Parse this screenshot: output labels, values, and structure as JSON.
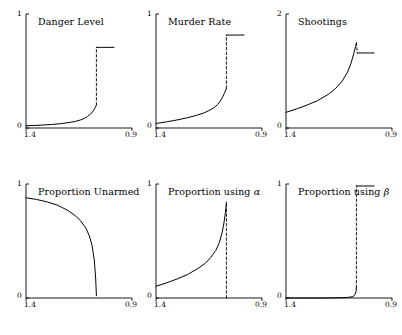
{
  "figure": {
    "kind": "small-multiples-line-grid",
    "rows": 2,
    "cols": 3,
    "background": "#ffffff",
    "line_color": "#000000",
    "axis_color": "#000000"
  },
  "chart_data": [
    {
      "type": "line",
      "title": "Danger Level",
      "xlabel": "",
      "ylabel": "",
      "xticklabels": [
        "1.4",
        "0.9"
      ],
      "yticklabels": [
        "0",
        "1"
      ],
      "xlim": [
        1.4,
        0.9
      ],
      "ylim": [
        0,
        1
      ],
      "x_reversed": true,
      "grid": false,
      "legend": "none",
      "annotations": [
        "dashed vertical discontinuity line at x = 1.0"
      ],
      "series": [
        {
          "name": "lower branch",
          "style": "solid",
          "x": [
            1.4,
            1.35,
            1.3,
            1.25,
            1.2,
            1.15,
            1.12,
            1.09,
            1.07,
            1.05,
            1.035,
            1.02,
            1.01,
            1.005,
            1.0
          ],
          "values": [
            0.02,
            0.023,
            0.027,
            0.032,
            0.039,
            0.05,
            0.059,
            0.072,
            0.085,
            0.103,
            0.122,
            0.148,
            0.172,
            0.19,
            0.205
          ]
        },
        {
          "name": "upper branch",
          "style": "solid",
          "x": [
            1.0,
            0.97,
            0.94,
            0.9
          ],
          "values": [
            0.72,
            0.72,
            0.72,
            0.72
          ]
        },
        {
          "name": "jump",
          "style": "dashed",
          "x": [
            1.0,
            1.0
          ],
          "values": [
            0.205,
            0.72
          ]
        }
      ]
    },
    {
      "type": "line",
      "title": "Murder Rate",
      "xlabel": "",
      "ylabel": "",
      "xticklabels": [
        "1.4",
        "0.9"
      ],
      "yticklabels": [
        "0",
        "1"
      ],
      "xlim": [
        1.4,
        0.9
      ],
      "ylim": [
        0,
        1
      ],
      "x_reversed": true,
      "grid": false,
      "legend": "none",
      "annotations": [
        "dashed vertical discontinuity line at x = 1.0"
      ],
      "series": [
        {
          "name": "lower branch",
          "style": "solid",
          "x": [
            1.4,
            1.34,
            1.28,
            1.22,
            1.17,
            1.13,
            1.1,
            1.07,
            1.05,
            1.035,
            1.02,
            1.01,
            1.004,
            1.0
          ],
          "values": [
            0.04,
            0.055,
            0.072,
            0.092,
            0.113,
            0.133,
            0.155,
            0.182,
            0.21,
            0.24,
            0.28,
            0.315,
            0.34,
            0.355
          ]
        },
        {
          "name": "upper branch",
          "style": "solid",
          "x": [
            1.0,
            0.96,
            0.93,
            0.9
          ],
          "values": [
            0.83,
            0.83,
            0.83,
            0.83
          ]
        },
        {
          "name": "jump",
          "style": "dashed",
          "x": [
            1.0,
            1.0
          ],
          "values": [
            0.355,
            0.83
          ]
        }
      ]
    },
    {
      "type": "line",
      "title": "Shootings",
      "xlabel": "",
      "ylabel": "",
      "xticklabels": [
        "1.4",
        "0.9"
      ],
      "yticklabels": [
        "0",
        "2"
      ],
      "xlim": [
        1.4,
        0.9
      ],
      "ylim": [
        0,
        2
      ],
      "x_reversed": true,
      "grid": false,
      "legend": "none",
      "annotations": [
        "curve peaks near x = 1.0 then upper branch continues at a slightly lower level"
      ],
      "series": [
        {
          "name": "lower branch",
          "style": "solid",
          "x": [
            1.4,
            1.34,
            1.28,
            1.22,
            1.16,
            1.12,
            1.08,
            1.05,
            1.03,
            1.015,
            1.005,
            1.0
          ],
          "values": [
            0.28,
            0.34,
            0.41,
            0.49,
            0.6,
            0.7,
            0.84,
            1.0,
            1.16,
            1.33,
            1.45,
            1.52
          ]
        },
        {
          "name": "upper branch",
          "style": "solid",
          "x": [
            0.995,
            0.96,
            0.93,
            0.9
          ],
          "values": [
            1.34,
            1.34,
            1.34,
            1.34
          ]
        },
        {
          "name": "jump",
          "style": "dashed",
          "x": [
            1.0,
            0.995
          ],
          "values": [
            1.52,
            1.34
          ]
        }
      ]
    },
    {
      "type": "line",
      "title": "Proportion Unarmed",
      "xlabel": "",
      "ylabel": "",
      "xticklabels": [
        "1.4",
        "0.9"
      ],
      "yticklabels": [
        "0",
        "1"
      ],
      "xlim": [
        1.4,
        0.9
      ],
      "ylim": [
        0,
        1
      ],
      "x_reversed": true,
      "grid": false,
      "legend": "none",
      "annotations": [
        "curve falls to zero at x = 1.0"
      ],
      "series": [
        {
          "name": "proportion unarmed",
          "style": "solid",
          "x": [
            1.4,
            1.34,
            1.28,
            1.22,
            1.16,
            1.12,
            1.09,
            1.06,
            1.04,
            1.025,
            1.012,
            1.004,
            1.0
          ],
          "values": [
            0.895,
            0.88,
            0.858,
            0.828,
            0.78,
            0.735,
            0.69,
            0.625,
            0.555,
            0.47,
            0.34,
            0.17,
            0.02
          ]
        }
      ]
    },
    {
      "type": "line",
      "title_prefix": "Proportion using ",
      "title_symbol": "α",
      "title": "Proportion using α",
      "xlabel": "",
      "ylabel": "",
      "xticklabels": [
        "1.4",
        "0.9"
      ],
      "yticklabels": [
        "0",
        "1"
      ],
      "xlim": [
        1.4,
        0.9
      ],
      "ylim": [
        0,
        1
      ],
      "x_reversed": true,
      "grid": false,
      "legend": "none",
      "annotations": [
        "dashed vertical line at x = 1.0"
      ],
      "series": [
        {
          "name": "proportion using alpha",
          "style": "solid",
          "x": [
            1.4,
            1.34,
            1.28,
            1.22,
            1.16,
            1.12,
            1.09,
            1.06,
            1.04,
            1.025,
            1.015,
            1.007,
            1.002,
            1.0
          ],
          "values": [
            0.105,
            0.135,
            0.17,
            0.21,
            0.265,
            0.31,
            0.36,
            0.425,
            0.495,
            0.58,
            0.66,
            0.745,
            0.815,
            0.855
          ]
        },
        {
          "name": "vertical marker",
          "style": "dashed",
          "x": [
            1.0,
            1.0
          ],
          "values": [
            0.0,
            0.855
          ]
        }
      ]
    },
    {
      "type": "line",
      "title_prefix": "Proportion using ",
      "title_symbol": "β",
      "title": "Proportion using β",
      "xlabel": "",
      "ylabel": "",
      "xticklabels": [
        "1.4",
        "0.9"
      ],
      "yticklabels": [
        "0",
        "1"
      ],
      "xlim": [
        1.4,
        0.9
      ],
      "ylim": [
        0,
        1
      ],
      "x_reversed": true,
      "grid": false,
      "legend": "none",
      "annotations": [
        "step from 0 to 1 at x = 1.0, dashed vertical line at x = 1.0"
      ],
      "series": [
        {
          "name": "lower branch",
          "style": "solid",
          "x": [
            1.4,
            1.2,
            1.1,
            1.05,
            1.02,
            1.008,
            1.002,
            1.0
          ],
          "values": [
            0.0,
            0.0,
            0.002,
            0.005,
            0.012,
            0.03,
            0.06,
            0.09
          ]
        },
        {
          "name": "upper branch",
          "style": "solid",
          "x": [
            1.0,
            0.96,
            0.93,
            0.9
          ],
          "values": [
            1.0,
            1.0,
            1.0,
            1.0
          ]
        },
        {
          "name": "jump",
          "style": "dashed",
          "x": [
            1.0,
            1.0
          ],
          "values": [
            0.09,
            1.0
          ]
        }
      ]
    }
  ]
}
